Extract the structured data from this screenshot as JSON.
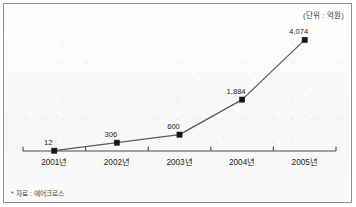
{
  "figure": {
    "unit_label": "(단위 : 억원)",
    "source_note": "* 자료 : 에어크로스"
  },
  "chart_data": {
    "type": "line",
    "title": "",
    "subtitle": "",
    "xlabel": "",
    "ylabel": "",
    "unit": "억원",
    "categories": [
      "2001년",
      "2002년",
      "2003년",
      "2004년",
      "2005년"
    ],
    "values": [
      12,
      306,
      600,
      1884,
      4074
    ],
    "value_labels": [
      "12",
      "306",
      "600",
      "1,884",
      "4,074"
    ],
    "ylim": [
      0,
      4400
    ],
    "grid": false,
    "legend": null,
    "marker": "square",
    "series": [
      {
        "name": "매출액",
        "values": [
          12,
          306,
          600,
          1884,
          4074
        ]
      }
    ],
    "colors": {
      "line": "#5b5b5b",
      "marker": "#141414",
      "axis": "#4a4a4a",
      "background": "#fbfbfa",
      "border": "#8e8e8e",
      "text": "#1d1d1d"
    }
  }
}
